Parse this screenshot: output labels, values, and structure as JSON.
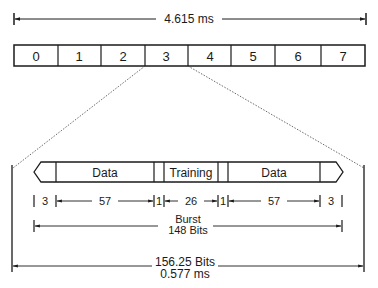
{
  "frame": {
    "duration_label": "4.615 ms",
    "slots": [
      "0",
      "1",
      "2",
      "3",
      "4",
      "5",
      "6",
      "7"
    ],
    "expanded_slot": "3"
  },
  "burst": {
    "fields": {
      "data_left": "Data",
      "training": "Training",
      "data_right": "Data"
    },
    "bit_counts": {
      "tail_left": "3",
      "data_left": "57",
      "flag_left": "1",
      "training": "26",
      "flag_right": "1",
      "data_right": "57",
      "tail_right": "3"
    },
    "burst_label_line1": "Burst",
    "burst_label_line2": "148 Bits"
  },
  "slot_period": {
    "label_line1": "156.25 Bits",
    "label_line2": "0.577 ms"
  },
  "colors": {
    "ink": "#1a1a1a",
    "background": "#ffffff"
  }
}
